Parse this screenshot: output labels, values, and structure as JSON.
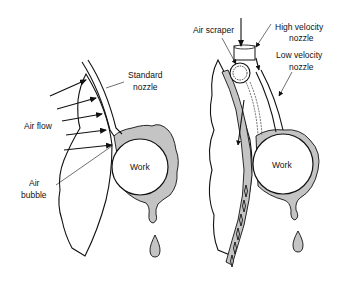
{
  "figure": {
    "left_panel": {
      "labels": {
        "nozzle_line1": "Standard",
        "nozzle_line2": "nozzle",
        "air_flow": "Air flow",
        "air_bubble_line1": "Air",
        "air_bubble_line2": "bubble",
        "work": "Work"
      }
    },
    "right_panel": {
      "labels": {
        "air_scraper": "Air scraper",
        "high_velocity_line1": "High velocity",
        "high_velocity_line2": "nozzle",
        "low_velocity_line1": "Low velocity",
        "low_velocity_line2": "nozzle",
        "work": "Work"
      }
    },
    "colors": {
      "ink": "#111111",
      "film": "#c4c4c4",
      "background": "#ffffff"
    }
  }
}
